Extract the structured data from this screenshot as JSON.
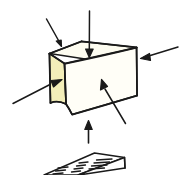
{
  "figure": {
    "background_color": "#ffffff",
    "ink_color": "#1a1a1a",
    "caption": ""
  },
  "box": {
    "name": "rectangular-prism",
    "faces": {
      "left": {
        "label": "left-face",
        "fill": "#f3eeb9",
        "stroke": "#1a1a1a"
      },
      "top": {
        "label": "top-face",
        "fill": "#fdfcf0",
        "stroke": "#1a1a1a"
      },
      "front": {
        "label": "front-face",
        "fill": "#fffef7",
        "stroke": "#1a1a1a"
      }
    }
  },
  "arrows": [
    {
      "id": "arrow-top-left-diagonal",
      "direction": "down-right",
      "target": "top-face",
      "color": "#1a1a1a"
    },
    {
      "id": "arrow-top-vertical",
      "direction": "down",
      "target": "top-face",
      "color": "#1a1a1a"
    },
    {
      "id": "arrow-right-horizontal",
      "direction": "left",
      "target": "right-edge",
      "color": "#1a1a1a"
    },
    {
      "id": "arrow-left-diagonal",
      "direction": "up-right",
      "target": "left-face",
      "color": "#1a1a1a"
    },
    {
      "id": "arrow-front-diagonal",
      "direction": "up-left",
      "target": "front-face",
      "color": "#1a1a1a"
    },
    {
      "id": "arrow-bottom-vertical",
      "direction": "up",
      "target": "bottom-edge",
      "color": "#1a1a1a"
    }
  ],
  "slab": {
    "name": "hatched-slab",
    "label": "flat slab with ridged top",
    "fill": "#ffffff",
    "stroke": "#1a1a1a",
    "hatch_groups": 3,
    "clipped": true
  }
}
